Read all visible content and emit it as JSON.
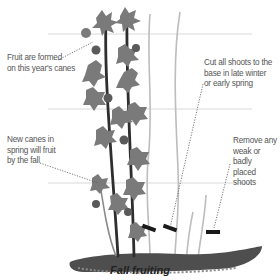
{
  "diagram": {
    "title": "Fall fruiting",
    "annotations": [
      {
        "id": "fruit-formed",
        "text_lines": [
          "Fruit are formed",
          "on this year's canes"
        ]
      },
      {
        "id": "new-canes",
        "text_lines": [
          "New canes in",
          "spring will fruit",
          "by the fall"
        ]
      },
      {
        "id": "cut-shoots",
        "text_lines": [
          "Cut all shoots to the",
          "base in late winter",
          "or early spring"
        ]
      },
      {
        "id": "remove-weak",
        "text_lines": [
          "Remove any",
          "weak or badly",
          "placed shoots"
        ]
      }
    ],
    "colors": {
      "guide_line": "#c8c8c8",
      "leaf": "#7a7a7a",
      "leaf_dark": "#5a5a5a",
      "cane": "#2e2e2e",
      "cut_cane": "#bdbdbd",
      "soil": "#555555",
      "text": "#555555",
      "cut_mark": "#1a1a1a"
    }
  }
}
